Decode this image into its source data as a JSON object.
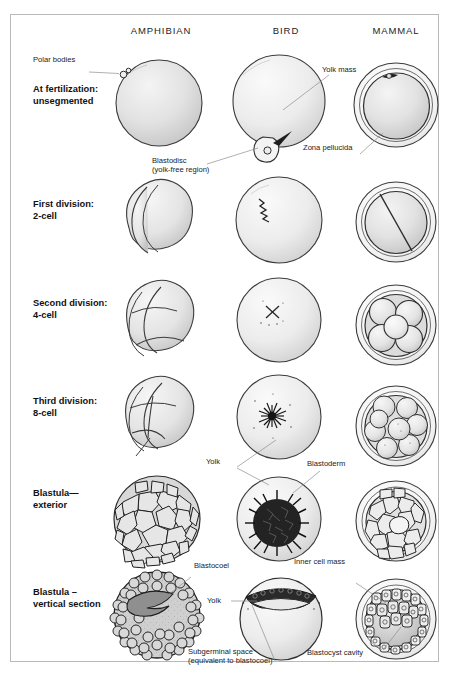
{
  "figure": {
    "border_color": "#b9b9b9",
    "background": "#ffffff"
  },
  "columns": [
    {
      "id": "amphibian",
      "label": "AMPHIBIAN"
    },
    {
      "id": "bird",
      "label": "BIRD"
    },
    {
      "id": "mammal",
      "label": "MAMMAL"
    }
  ],
  "rows": [
    {
      "id": "fertilization",
      "label": "At fertilization:\nunsegmented"
    },
    {
      "id": "first-division",
      "label": "First division:\n2-cell"
    },
    {
      "id": "second-division",
      "label": "Second division:\n4-cell"
    },
    {
      "id": "third-division",
      "label": "Third division:\n 8-cell"
    },
    {
      "id": "blastula-exterior",
      "label": "Blastula—\nexterior"
    },
    {
      "id": "blastula-section",
      "label": "Blastula –\nvertical section"
    }
  ],
  "annotations": [
    {
      "id": "polar-bodies",
      "text": "Polar bodies"
    },
    {
      "id": "yolk-mass",
      "text": "Yolk mass"
    },
    {
      "id": "blastodisc",
      "text": "Blastodisc\n(yolk-free region)"
    },
    {
      "id": "zona-pellucida",
      "text": "Zona pellucida"
    },
    {
      "id": "yolk-blastula",
      "text": "Yolk"
    },
    {
      "id": "blastoderm",
      "text": "Blastoderm"
    },
    {
      "id": "blastocoel",
      "text": "Blastocoel"
    },
    {
      "id": "yolk-section",
      "text": "Yolk"
    },
    {
      "id": "subgerminal-space",
      "text": "Subgerminal space\n(equivalent to blastocoel)"
    },
    {
      "id": "inner-cell-mass",
      "text": "Inner cell mass"
    },
    {
      "id": "blastocyst-cavity",
      "text": "Blastocyst cavity"
    }
  ],
  "palette": {
    "ink": "#2b2b2b",
    "cell_fill_light": "#e8e8e8",
    "cell_fill_mid": "#d2d2d2",
    "cell_fill_dark": "#8d8d8d",
    "leader_line": "#8e8e8e",
    "frame": "#b9b9b9"
  }
}
